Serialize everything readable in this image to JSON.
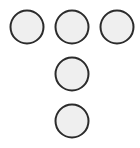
{
  "diagram": {
    "style": {
      "fill": "#efefef",
      "stroke": "#2b2b2b",
      "stroke_width": 2,
      "radius": 16.5
    },
    "circles": [
      {
        "id": "top-left",
        "cx": 27,
        "cy": 27
      },
      {
        "id": "top-middle",
        "cx": 72,
        "cy": 27
      },
      {
        "id": "top-right",
        "cx": 117,
        "cy": 27
      },
      {
        "id": "middle",
        "cx": 72,
        "cy": 74
      },
      {
        "id": "bottom",
        "cx": 72,
        "cy": 121
      }
    ]
  }
}
